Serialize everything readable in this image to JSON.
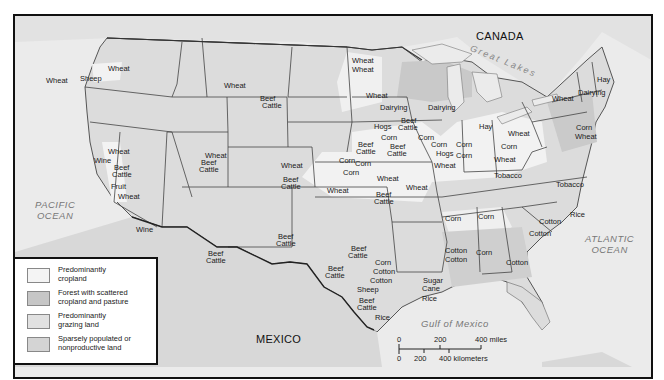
{
  "map": {
    "countries": {
      "canada": "CANADA",
      "mexico": "MEXICO"
    },
    "water": {
      "pacific": "PACIFIC OCEAN",
      "pacific_line1": "PACIFIC",
      "pacific_line2": "OCEAN",
      "atlantic_line1": "ATLANTIC",
      "atlantic_line2": "OCEAN",
      "gulf": "Gulf of Mexico",
      "great_lakes": "Great Lakes"
    },
    "colors": {
      "cropland": "#f4f4f4",
      "forest": "#c9c9c9",
      "grazing": "#dedede",
      "sparse": "#d6d6d6",
      "ocean": "#ebebeb",
      "border": "#444444"
    },
    "labels": [
      {
        "text": "Wheat",
        "x": 108,
        "y": 65
      },
      {
        "text": "Sheep",
        "x": 80,
        "y": 75
      },
      {
        "text": "Wheat",
        "x": 46,
        "y": 77
      },
      {
        "text": "Wheat",
        "x": 224,
        "y": 82
      },
      {
        "text": "Beef",
        "x": 260,
        "y": 95
      },
      {
        "text": "Cattle",
        "x": 262,
        "y": 102
      },
      {
        "text": "Wheat",
        "x": 352,
        "y": 57
      },
      {
        "text": "Wheat",
        "x": 352,
        "y": 66
      },
      {
        "text": "Wheat",
        "x": 366,
        "y": 92
      },
      {
        "text": "Dairying",
        "x": 380,
        "y": 104
      },
      {
        "text": "Dairying",
        "x": 428,
        "y": 104
      },
      {
        "text": "Hogs",
        "x": 374,
        "y": 123
      },
      {
        "text": "Beef",
        "x": 401,
        "y": 117
      },
      {
        "text": "Cattle",
        "x": 398,
        "y": 124
      },
      {
        "text": "Corn",
        "x": 381,
        "y": 134
      },
      {
        "text": "Corn",
        "x": 418,
        "y": 134
      },
      {
        "text": "Beef",
        "x": 358,
        "y": 141
      },
      {
        "text": "Cattle",
        "x": 356,
        "y": 148
      },
      {
        "text": "Beef",
        "x": 390,
        "y": 143
      },
      {
        "text": "Cattle",
        "x": 387,
        "y": 150
      },
      {
        "text": "Corn",
        "x": 431,
        "y": 141
      },
      {
        "text": "Hogs",
        "x": 436,
        "y": 150
      },
      {
        "text": "Corn",
        "x": 456,
        "y": 141
      },
      {
        "text": "Corn",
        "x": 456,
        "y": 152
      },
      {
        "text": "Wheat",
        "x": 434,
        "y": 162
      },
      {
        "text": "Hay",
        "x": 479,
        "y": 123
      },
      {
        "text": "Wheat",
        "x": 508,
        "y": 130
      },
      {
        "text": "Corn",
        "x": 501,
        "y": 143
      },
      {
        "text": "Wheat",
        "x": 494,
        "y": 156
      },
      {
        "text": "Tobacco",
        "x": 494,
        "y": 172
      },
      {
        "text": "Tobacco",
        "x": 556,
        "y": 181
      },
      {
        "text": "Hay",
        "x": 597,
        "y": 76
      },
      {
        "text": "Dairying",
        "x": 578,
        "y": 89
      },
      {
        "text": "Wheat",
        "x": 552,
        "y": 95
      },
      {
        "text": "Corn",
        "x": 576,
        "y": 124
      },
      {
        "text": "Wheat",
        "x": 575,
        "y": 133
      },
      {
        "text": "Wheat",
        "x": 281,
        "y": 162
      },
      {
        "text": "Beef",
        "x": 283,
        "y": 176
      },
      {
        "text": "Cattle",
        "x": 281,
        "y": 183
      },
      {
        "text": "Corn",
        "x": 339,
        "y": 157
      },
      {
        "text": "Corn",
        "x": 355,
        "y": 160
      },
      {
        "text": "Corn",
        "x": 343,
        "y": 169
      },
      {
        "text": "Wheat",
        "x": 377,
        "y": 175
      },
      {
        "text": "Wheat",
        "x": 327,
        "y": 187
      },
      {
        "text": "Wheat",
        "x": 406,
        "y": 184
      },
      {
        "text": "Beef",
        "x": 376,
        "y": 191
      },
      {
        "text": "Cattle",
        "x": 374,
        "y": 198
      },
      {
        "text": "Wheat",
        "x": 205,
        "y": 152
      },
      {
        "text": "Beef",
        "x": 201,
        "y": 159
      },
      {
        "text": "Cattle",
        "x": 199,
        "y": 166
      },
      {
        "text": "Wheat",
        "x": 108,
        "y": 148
      },
      {
        "text": "Wine",
        "x": 94,
        "y": 157
      },
      {
        "text": "Beef",
        "x": 114,
        "y": 164
      },
      {
        "text": "Cattle",
        "x": 112,
        "y": 171
      },
      {
        "text": "Fruit",
        "x": 111,
        "y": 183
      },
      {
        "text": "Wheat",
        "x": 118,
        "y": 193
      },
      {
        "text": "Wine",
        "x": 136,
        "y": 226
      },
      {
        "text": "Beef",
        "x": 208,
        "y": 250
      },
      {
        "text": "Cattle",
        "x": 206,
        "y": 257
      },
      {
        "text": "Beef",
        "x": 278,
        "y": 233
      },
      {
        "text": "Cattle",
        "x": 276,
        "y": 240
      },
      {
        "text": "Beef",
        "x": 351,
        "y": 245
      },
      {
        "text": "Cattle",
        "x": 348,
        "y": 252
      },
      {
        "text": "Beef",
        "x": 328,
        "y": 265
      },
      {
        "text": "Cattle",
        "x": 325,
        "y": 272
      },
      {
        "text": "Corn",
        "x": 375,
        "y": 259
      },
      {
        "text": "Cotton",
        "x": 373,
        "y": 268
      },
      {
        "text": "Cotton",
        "x": 370,
        "y": 277
      },
      {
        "text": "Sheep",
        "x": 357,
        "y": 286
      },
      {
        "text": "Beef",
        "x": 359,
        "y": 297
      },
      {
        "text": "Cattle",
        "x": 357,
        "y": 304
      },
      {
        "text": "Rice",
        "x": 375,
        "y": 314
      },
      {
        "text": "Corn",
        "x": 445,
        "y": 215
      },
      {
        "text": "Corn",
        "x": 478,
        "y": 213
      },
      {
        "text": "Cotton",
        "x": 539,
        "y": 218
      },
      {
        "text": "Cotton",
        "x": 529,
        "y": 230
      },
      {
        "text": "Rice",
        "x": 570,
        "y": 211
      },
      {
        "text": "Cotton",
        "x": 445,
        "y": 247
      },
      {
        "text": "Cotton",
        "x": 445,
        "y": 256
      },
      {
        "text": "Corn",
        "x": 476,
        "y": 249
      },
      {
        "text": "Cotton",
        "x": 506,
        "y": 259
      },
      {
        "text": "Sugar",
        "x": 423,
        "y": 277
      },
      {
        "text": "Cane",
        "x": 422,
        "y": 285
      },
      {
        "text": "Rice",
        "x": 422,
        "y": 295
      }
    ]
  },
  "legend": {
    "title": "",
    "items": [
      {
        "line1": "Predominantly",
        "line2": "cropland",
        "swatch": "#f4f4f4"
      },
      {
        "line1": "Forest with scattered",
        "line2": "cropland and pasture",
        "swatch": "#c6c6c6"
      },
      {
        "line1": "Predominantly",
        "line2": "grazing land",
        "swatch": "#e1e1e1"
      },
      {
        "line1": "Sparsely populated or",
        "line2": "nonproductive land",
        "swatch": "#d4d4d4"
      }
    ]
  },
  "scale_bar": {
    "miles": {
      "ticks": [
        "0",
        "200",
        "400 miles"
      ]
    },
    "kilometers": {
      "ticks": [
        "0",
        "200",
        "400 kilometers"
      ]
    }
  }
}
